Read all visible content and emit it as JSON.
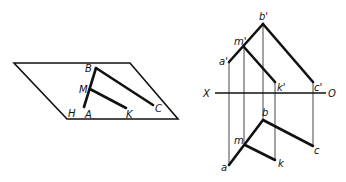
{
  "figure": {
    "pictorial": {
      "plane_label": "H",
      "points": [
        {
          "name": "B",
          "label": "B"
        },
        {
          "name": "M",
          "label": "M"
        },
        {
          "name": "A",
          "label": "A"
        },
        {
          "name": "K",
          "label": "K"
        },
        {
          "name": "C",
          "label": "C"
        },
        {
          "name": "H",
          "label": "H"
        }
      ]
    },
    "projection": {
      "axis_left": "X",
      "axis_right": "O",
      "front_view": [
        {
          "name": "b-prime",
          "label": "b'"
        },
        {
          "name": "m-prime",
          "label": "m'"
        },
        {
          "name": "a-prime",
          "label": "a'"
        },
        {
          "name": "k-prime",
          "label": "k'"
        },
        {
          "name": "c-prime",
          "label": "c'"
        }
      ],
      "top_view": [
        {
          "name": "b",
          "label": "b"
        },
        {
          "name": "m",
          "label": "m"
        },
        {
          "name": "a",
          "label": "a"
        },
        {
          "name": "k",
          "label": "k"
        },
        {
          "name": "c",
          "label": "c"
        }
      ]
    }
  }
}
